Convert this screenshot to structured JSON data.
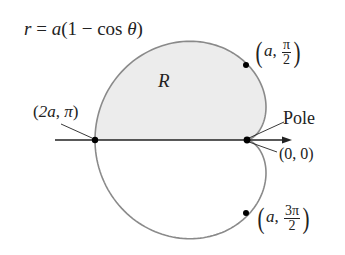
{
  "diagram": {
    "equation": {
      "lhs": "r",
      "eq": "=",
      "rhs_a": "a",
      "rhs_rest": "(1 − cos ",
      "theta": "θ",
      "close": ")"
    },
    "region_label": "R",
    "pole_label": "Pole",
    "points": [
      {
        "name": "left",
        "a": "2a",
        "theta": "π",
        "text": "(2a, π)"
      },
      {
        "name": "top",
        "a": "a",
        "theta_num": "π",
        "theta_den": "2"
      },
      {
        "name": "bottom",
        "a": "a",
        "theta_num": "3π",
        "theta_den": "2"
      },
      {
        "name": "origin",
        "text": "(0, 0)"
      }
    ],
    "colors": {
      "curve": "#8a8a8a",
      "fill": "#ececec",
      "axis": "#222222",
      "dot": "#000000"
    },
    "geometry": {
      "pole_x": 247,
      "pole_y": 140,
      "a_px": 76
    }
  }
}
